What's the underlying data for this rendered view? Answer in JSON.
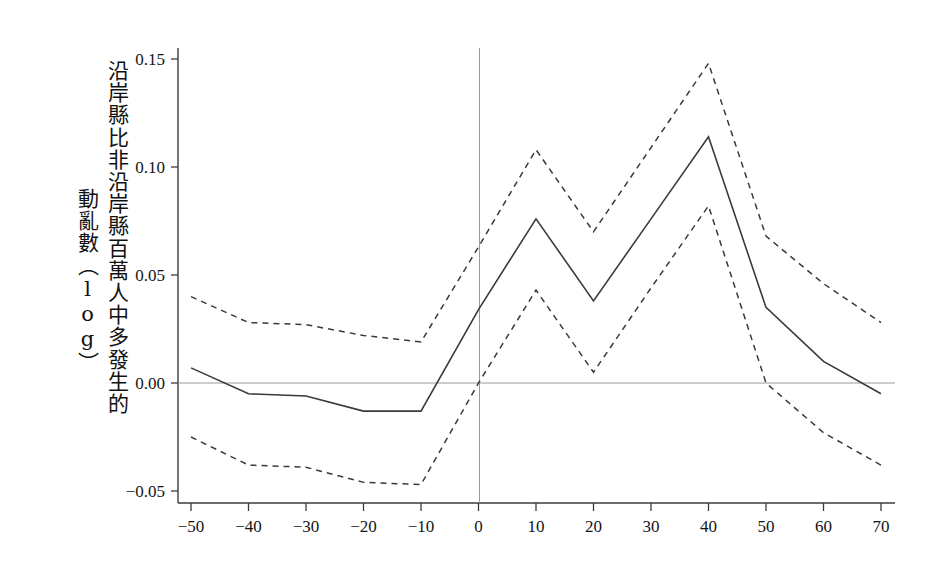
{
  "figure": {
    "background": "#ffffff",
    "axis_color": "#3b3b3b",
    "zero_line_color": "#9a9a9a",
    "vline_color": "#9a9a9a",
    "series_color": "#3a3a3a"
  },
  "ylabel": {
    "line1": "沿岸縣比非沿岸縣百萬人中多發生的",
    "line2": "動亂數（log）"
  },
  "chart_data": {
    "type": "line",
    "title": "",
    "xlabel": "",
    "ylabel": "沿岸縣比非沿岸縣百萬人中多發生的動亂數（log）",
    "xlim": [
      -55,
      75
    ],
    "ylim": [
      -0.058,
      0.158
    ],
    "grid": false,
    "legend": "none",
    "xticks": [
      -50,
      -40,
      -30,
      -20,
      -10,
      0,
      10,
      20,
      30,
      40,
      50,
      60,
      70
    ],
    "xtick_labels": [
      "−50",
      "−40",
      "−30",
      "−20",
      "−10",
      "0",
      "10",
      "20",
      "30",
      "40",
      "50",
      "60",
      "70"
    ],
    "yticks": [
      -0.05,
      0.0,
      0.05,
      0.1,
      0.15
    ],
    "ytick_labels": [
      "−0.05",
      "0.00",
      "0.05",
      "0.10",
      "0.15"
    ],
    "annotations": {
      "zero_hline": 0.0,
      "vertical_reference_line_x": 0
    },
    "x": [
      -50,
      -40,
      -30,
      -20,
      -10,
      0,
      10,
      20,
      30,
      40,
      50,
      60,
      70
    ],
    "series": [
      {
        "name": "point-estimate",
        "style": "solid",
        "values": [
          0.007,
          -0.005,
          -0.006,
          -0.013,
          -0.013,
          0.034,
          0.076,
          0.038,
          0.076,
          0.114,
          0.035,
          0.01,
          -0.005
        ]
      },
      {
        "name": "upper-confidence-bound",
        "style": "dashed",
        "values": [
          0.04,
          0.028,
          0.027,
          0.022,
          0.019,
          0.063,
          0.108,
          0.07,
          0.109,
          0.148,
          0.068,
          0.046,
          0.028
        ]
      },
      {
        "name": "lower-confidence-bound",
        "style": "dashed",
        "values": [
          -0.025,
          -0.038,
          -0.039,
          -0.046,
          -0.047,
          0.0,
          0.043,
          0.005,
          0.044,
          0.082,
          0.0,
          -0.023,
          -0.038
        ]
      }
    ]
  }
}
